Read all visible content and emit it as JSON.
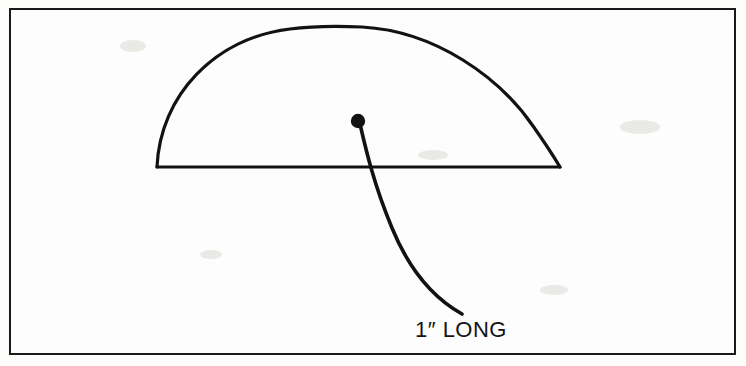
{
  "figure": {
    "kind": "line-art-diagram",
    "border_color": "#1a1a1a",
    "stroke_color": "#121212",
    "background_color": "#fdfdfc",
    "labels": {
      "dimension": "1″ LONG"
    },
    "parts": [
      {
        "name": "frame-border",
        "shape": "rectangle"
      },
      {
        "name": "canopy-arc",
        "shape": "semi-ellipse-arc"
      },
      {
        "name": "canopy-baseline",
        "shape": "horizontal-line"
      },
      {
        "name": "center-dot",
        "shape": "filled-circle"
      },
      {
        "name": "cord-curve",
        "shape": "curved-line"
      }
    ],
    "geometry": {
      "frame": {
        "x": 9,
        "y": 8,
        "width": 727,
        "height": 347
      },
      "baseline": {
        "x1": 157,
        "y1": 167,
        "x2": 560,
        "y2": 167
      },
      "apex": {
        "x": 359,
        "y": 27
      },
      "center_dot": {
        "cx": 358,
        "cy": 121,
        "r": 7
      },
      "cord_end": {
        "x": 462,
        "y": 315
      }
    }
  }
}
